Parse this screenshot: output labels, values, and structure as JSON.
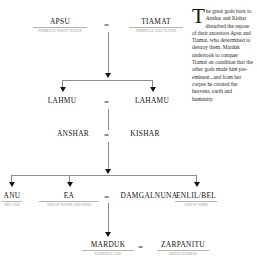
{
  "diagram": {
    "caption": {
      "dropcap": "T",
      "text": "he great gods born to Anshar and Kishar disturbed the repose of their ancestors Apsu and Tiamat, who determined to destroy them. Marduk undertook to conquer Tiamat on condition that the other gods made him pre-eminent...and from her corpse he created the heavens, earth and humanity."
    },
    "equals_symbol": "=",
    "generations": [
      {
        "id": "gen1",
        "nodes": [
          {
            "name": "Apsu",
            "subtitle": "Primeval sweet water"
          },
          {
            "name": "Tiamat",
            "subtitle": "Primeval salt water"
          }
        ]
      },
      {
        "id": "gen2",
        "nodes": [
          {
            "name": "Lahmu",
            "subtitle": ""
          },
          {
            "name": "Lahamu",
            "subtitle": ""
          }
        ]
      },
      {
        "id": "gen3",
        "nodes": [
          {
            "name": "Anshar",
            "subtitle": ""
          },
          {
            "name": "Kishar",
            "subtitle": ""
          }
        ]
      },
      {
        "id": "gen4",
        "nodes": [
          {
            "name": "Anu",
            "subtitle": "Sky god"
          },
          {
            "name": "Ea",
            "subtitle": "God of water and wind"
          },
          {
            "name": "Damgalnuna",
            "subtitle": ""
          },
          {
            "name": "Enlil/Bel",
            "subtitle": "God of wind"
          }
        ]
      },
      {
        "id": "gen5",
        "nodes": [
          {
            "name": "Marduk",
            "subtitle": "National god"
          },
          {
            "name": "Zarpanitu",
            "subtitle": "Birth goddess"
          }
        ]
      }
    ],
    "colors": {
      "ink": "#15130f",
      "rule": "#b9b4ab",
      "subtitle": "#9a948b",
      "connector": "#8e8a84",
      "arrow": "#161412",
      "background": "#ffffff"
    }
  }
}
